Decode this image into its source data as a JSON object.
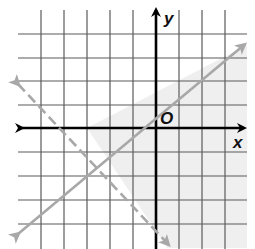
{
  "diagram": {
    "type": "coordinate-plane-inequality-graph",
    "labels": {
      "x_axis": "x",
      "y_axis": "y",
      "origin": "O"
    },
    "grid": {
      "x_range": [
        -6,
        4
      ],
      "y_range": [
        -5,
        5
      ],
      "unit_px": 23.4,
      "origin_px": [
        156,
        128
      ]
    },
    "boundary_lines": [
      {
        "name": "solid-boundary",
        "style": "solid",
        "color": "#a8a8a8",
        "points": [
          [
            -3,
            0
          ],
          [
            0,
            1
          ]
        ],
        "equation": "y = (1/3)x + 1 (approx, y-intercept ~1)"
      },
      {
        "name": "dashed-boundary",
        "style": "dashed",
        "color": "#a8a8a8",
        "points": [
          [
            -3,
            0
          ],
          [
            0,
            -4
          ]
        ],
        "equation": "y = -(4/3)x - 4 (approx)"
      }
    ],
    "shading": {
      "color": "#eeeeee",
      "region": "below solid line and right of dashed line"
    },
    "colors": {
      "grid": "#555555",
      "axis": "#000000",
      "boundary": "#a8a8a8",
      "shade": "#efefef"
    }
  }
}
